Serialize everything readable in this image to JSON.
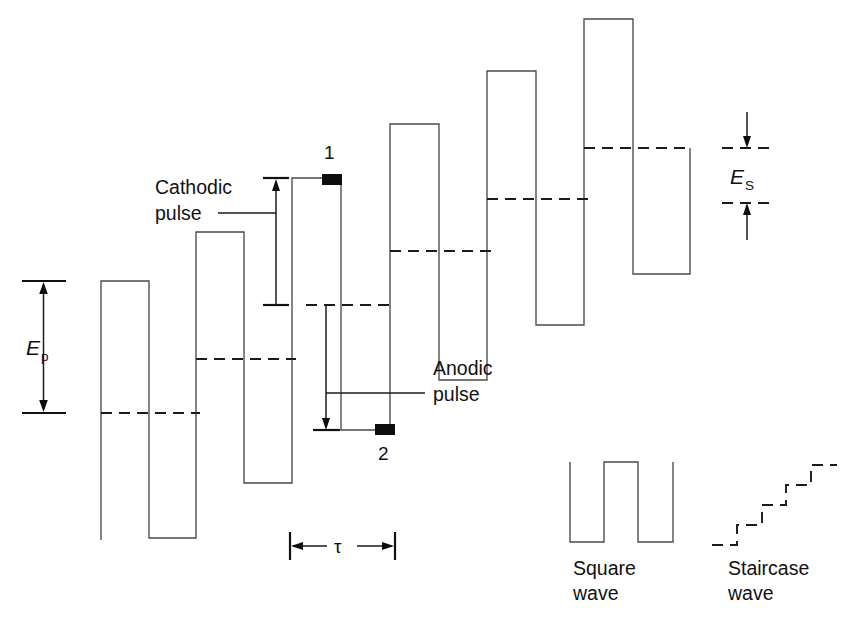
{
  "figure": {
    "background_color": "#ffffff",
    "line_color": "#4a4a4a",
    "annotation_color": "#111111",
    "marker_color": "#0d0d0d"
  },
  "labels": {
    "cathodic_line1": "Cathodic",
    "cathodic_line2": "pulse",
    "anodic_line1": "Anodic",
    "anodic_line2": "pulse",
    "point_1": "1",
    "point_2": "2",
    "tau": "τ",
    "e_p": "E",
    "e_p_sub": "p",
    "e_s": "E",
    "e_s_sub": "S",
    "square_wave_line1": "Square",
    "square_wave_line2": "wave",
    "staircase_wave_line1": "Staircase",
    "staircase_wave_line2": "wave"
  },
  "chart_data": {
    "type": "line",
    "xlabel": "Time",
    "ylabel": "Potential (E)",
    "grid": false,
    "legend": "none",
    "note": "Potential axis increases downward on screen is inverted; pulses step upward to the right. Coordinates are pixel positions in the 857x626 image.",
    "series": [
      {
        "name": "square-wave-superimposed-on-staircase",
        "comment": "Main excitation waveform: alternating cathodic (up) and anodic (down) pulses superimposed on an ascending staircase.",
        "points": [
          [
            101,
            540
          ],
          [
            101,
            281
          ],
          [
            149,
            281
          ],
          [
            149,
            538
          ],
          [
            196,
            538
          ],
          [
            196,
            232
          ],
          [
            244,
            232
          ],
          [
            244,
            483
          ],
          [
            292,
            483
          ],
          [
            292,
            178
          ],
          [
            341,
            178
          ],
          [
            341,
            430
          ],
          [
            390,
            430
          ],
          [
            390,
            124
          ],
          [
            439,
            124
          ],
          [
            439,
            380
          ],
          [
            487,
            380
          ],
          [
            487,
            71
          ],
          [
            536,
            71
          ],
          [
            536,
            325
          ],
          [
            584,
            325
          ],
          [
            584,
            19
          ],
          [
            633,
            19
          ],
          [
            633,
            274
          ],
          [
            690,
            274
          ],
          [
            690,
            148
          ]
        ]
      }
    ],
    "baselines_dashed": [
      {
        "name": "step-baseline-1",
        "y": 413,
        "x_start": 101,
        "x_end": 196
      },
      {
        "name": "step-baseline-2",
        "y": 359,
        "x_start": 196,
        "x_end": 292
      },
      {
        "name": "step-baseline-3",
        "y": 305,
        "x_start": 292,
        "x_end": 390
      },
      {
        "name": "step-baseline-4",
        "y": 251,
        "x_start": 390,
        "x_end": 487
      },
      {
        "name": "step-baseline-5",
        "y": 199,
        "x_start": 487,
        "x_end": 584
      },
      {
        "name": "step-baseline-6",
        "y": 148,
        "x_start": 584,
        "x_end": 690
      }
    ],
    "markers": [
      {
        "name": "current-sample-point-1",
        "label": "1",
        "x": 330,
        "y": 180,
        "phase": "end of cathodic pulse"
      },
      {
        "name": "current-sample-point-2",
        "label": "2",
        "x": 385,
        "y": 429,
        "phase": "end of anodic pulse"
      }
    ],
    "measurements": [
      {
        "name": "E_p",
        "label": "Ep",
        "description": "Pulse amplitude (peak-to-peak pulse height)",
        "y_top": 281,
        "y_bottom": 413,
        "x": 43
      },
      {
        "name": "E_s",
        "label": "Es",
        "description": "Staircase step height",
        "y_top": 148,
        "y_bottom": 203,
        "x": 748
      },
      {
        "name": "tau",
        "label": "τ",
        "description": "Square wave period",
        "x_start": 290,
        "x_end": 395,
        "y": 546
      }
    ],
    "inset_square_wave": {
      "name": "square-wave",
      "points": [
        [
          570,
          462
        ],
        [
          570,
          542
        ],
        [
          604,
          542
        ],
        [
          604,
          462
        ],
        [
          638,
          462
        ],
        [
          638,
          542
        ],
        [
          673,
          542
        ],
        [
          673,
          462
        ]
      ],
      "x_range": [
        570,
        673
      ],
      "y_range": [
        462,
        542
      ]
    },
    "inset_staircase_wave": {
      "name": "staircase-wave",
      "points": [
        [
          712,
          545
        ],
        [
          737,
          545
        ],
        [
          737,
          525
        ],
        [
          762,
          525
        ],
        [
          762,
          505
        ],
        [
          786,
          505
        ],
        [
          786,
          485
        ],
        [
          811,
          485
        ],
        [
          811,
          465
        ],
        [
          837,
          465
        ]
      ],
      "x_range": [
        712,
        837
      ],
      "y_range": [
        465,
        545
      ],
      "style": "dashed"
    }
  }
}
